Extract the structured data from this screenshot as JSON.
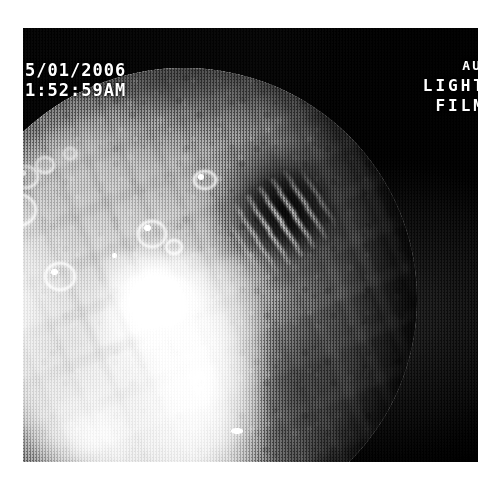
{
  "image": {
    "kind": "endoscopic-photograph",
    "color_mode": "grayscale",
    "field_of_view": "circular"
  },
  "overlay": {
    "timestamp": {
      "date": "5/01/2006",
      "time": "1:52:59AM"
    },
    "camera": {
      "above_label": "AU",
      "light_label": "LIGHT",
      "film_label": "FILM"
    }
  },
  "colors": {
    "page_background": "#ffffff",
    "frame_background": "#0b0b0b",
    "mucosa_midtone": "#9a9a9a",
    "highlight": "#ffffff",
    "shadow": "#070707",
    "overlay_text": "#ffffff"
  }
}
